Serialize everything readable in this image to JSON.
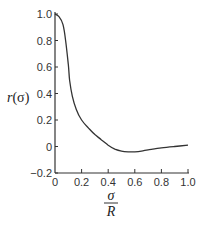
{
  "chart_data": {
    "type": "line",
    "title": "",
    "xlabel": "σ/R",
    "ylabel": "r(σ)",
    "xlim": [
      0,
      1.0
    ],
    "ylim": [
      -0.2,
      1.0
    ],
    "grid": false,
    "legend": null,
    "x_ticks": [
      "0",
      "0.2",
      "0.4",
      "0.6",
      "0.8",
      "1.0"
    ],
    "y_ticks": [
      "-0.2",
      "0",
      "0.2",
      "0.4",
      "0.6",
      "0.8",
      "1.0"
    ],
    "series": [
      {
        "name": "r(σ)",
        "x": [
          0.0,
          0.03,
          0.06,
          0.08,
          0.1,
          0.11,
          0.13,
          0.16,
          0.2,
          0.26,
          0.3,
          0.35,
          0.4,
          0.45,
          0.5,
          0.55,
          0.6,
          0.65,
          0.7,
          0.8,
          0.9,
          1.0
        ],
        "y": [
          1.0,
          0.98,
          0.92,
          0.8,
          0.62,
          0.5,
          0.38,
          0.28,
          0.2,
          0.13,
          0.09,
          0.05,
          0.01,
          -0.02,
          -0.035,
          -0.04,
          -0.04,
          -0.035,
          -0.025,
          -0.01,
          0.0,
          0.01
        ]
      }
    ]
  },
  "labels": {
    "ylabel_main": "r",
    "ylabel_arg": "(σ)",
    "xlabel_num": "σ",
    "xlabel_den": "R"
  }
}
